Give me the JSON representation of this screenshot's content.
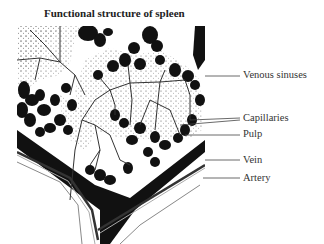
{
  "title": "Functional structure of spleen",
  "labels": [
    {
      "id": "venous-sinuses",
      "text": "Venous sinuses"
    },
    {
      "id": "capillaries",
      "text": "Capillaries"
    },
    {
      "id": "pulp",
      "text": "Pulp"
    },
    {
      "id": "vein",
      "text": "Vein"
    },
    {
      "id": "artery",
      "text": "Artery"
    }
  ]
}
